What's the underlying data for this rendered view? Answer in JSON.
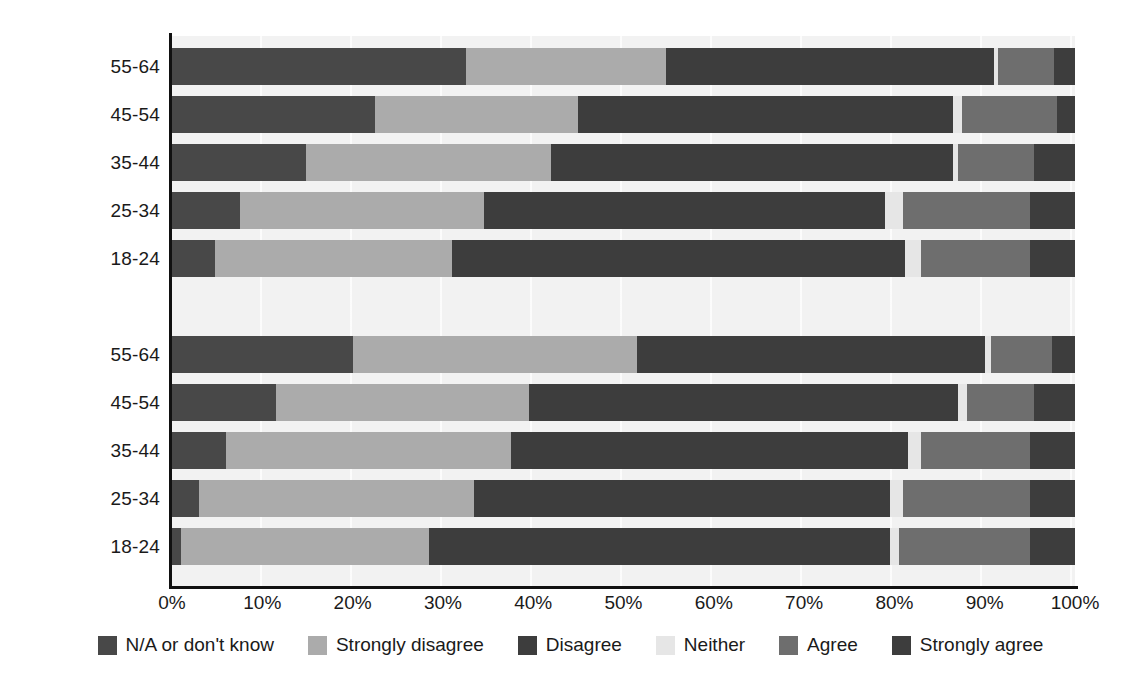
{
  "chart_data": {
    "type": "bar",
    "subtype": "stacked-horizontal-100",
    "title": "",
    "subtitle": "",
    "xlabel": "",
    "ylabel": "",
    "xlim": [
      0,
      100
    ],
    "grid": true,
    "legend_position": "bottom",
    "x_ticks": [
      "0%",
      "10%",
      "20%",
      "30%",
      "40%",
      "50%",
      "60%",
      "70%",
      "80%",
      "90%",
      "100%"
    ],
    "x_tick_values": [
      0,
      10,
      20,
      30,
      40,
      50,
      60,
      70,
      80,
      90,
      100
    ],
    "series": [
      {
        "name": "N/A or don't know",
        "color": "#484848"
      },
      {
        "name": "Strongly disagree",
        "color": "#ababab"
      },
      {
        "name": "Disagree",
        "color": "#3d3d3d"
      },
      {
        "name": "Neither",
        "color": "#e6e6e6"
      },
      {
        "name": "Agree",
        "color": "#6e6e6e"
      },
      {
        "name": "Strongly agree",
        "color": "#3d3d3d"
      }
    ],
    "groups": [
      {
        "name": "Women",
        "rows": [
          {
            "category": "55-64",
            "values": [
              34.5,
              23.5,
              38.5,
              0.5,
              6.5,
              2.5
            ]
          },
          {
            "category": "45-54",
            "values": [
              22.5,
              22.5,
              41.5,
              1.0,
              10.5,
              2.0
            ]
          },
          {
            "category": "35-44",
            "values": [
              14.8,
              27.2,
              44.5,
              0.5,
              8.5,
              4.5
            ]
          },
          {
            "category": "25-34",
            "values": [
              7.5,
              27.0,
              44.5,
              2.0,
              14.0,
              5.0
            ]
          },
          {
            "category": "18-24",
            "values": [
              4.8,
              26.2,
              50.2,
              1.8,
              12.0,
              5.0
            ]
          }
        ]
      },
      {
        "name": "Men",
        "rows": [
          {
            "category": "55-64",
            "values": [
              20.0,
              31.5,
              38.5,
              0.7,
              6.8,
              2.5
            ]
          },
          {
            "category": "45-54",
            "values": [
              11.5,
              28.0,
              47.5,
              1.0,
              7.5,
              4.5
            ]
          },
          {
            "category": "35-44",
            "values": [
              6.0,
              31.5,
              44.0,
              1.5,
              12.0,
              5.0
            ]
          },
          {
            "category": "25-34",
            "values": [
              3.0,
              30.5,
              46.0,
              1.5,
              14.0,
              5.0
            ]
          },
          {
            "category": "18-24",
            "values": [
              1.0,
              27.5,
              51.0,
              1.0,
              14.5,
              5.0
            ]
          }
        ]
      }
    ]
  },
  "legend": {
    "items": [
      {
        "label": "N/A or don't know",
        "color": "#484848"
      },
      {
        "label": "Strongly disagree",
        "color": "#ababab"
      },
      {
        "label": "Disagree",
        "color": "#3d3d3d"
      },
      {
        "label": "Neither",
        "color": "#e6e6e6"
      },
      {
        "label": "Agree",
        "color": "#6e6e6e"
      },
      {
        "label": "Strongly agree",
        "color": "#3d3d3d"
      }
    ]
  }
}
